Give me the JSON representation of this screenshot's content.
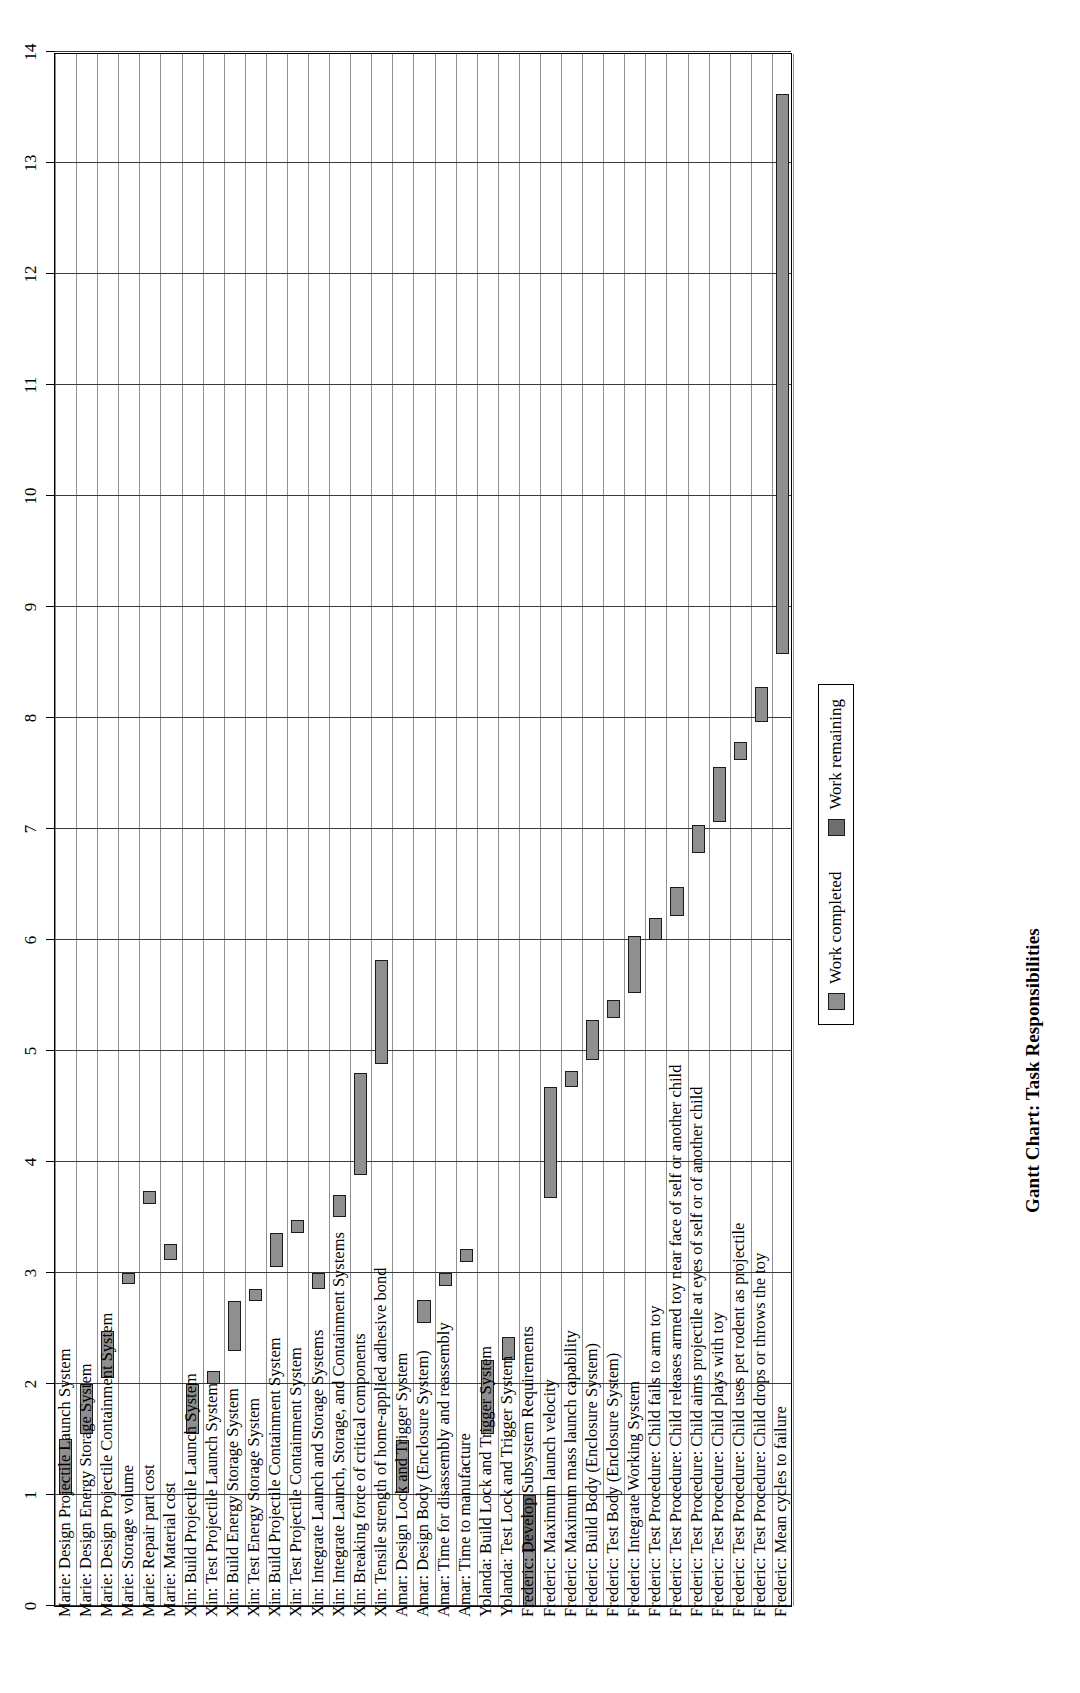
{
  "chart_data": {
    "type": "bar",
    "title": "Gantt Chart: Task Responsibilities",
    "xlabel": "",
    "ylabel": "",
    "ylim": [
      0,
      14
    ],
    "grid": true,
    "legend_position": "bottom-right",
    "orientation": "horizontal-rotated",
    "value_ticks": [
      0,
      1,
      2,
      3,
      4,
      5,
      6,
      7,
      8,
      9,
      10,
      11,
      12,
      13,
      14
    ],
    "series": [
      {
        "name": "Work completed",
        "color": "#8f8f8f"
      },
      {
        "name": "Work remaining",
        "color": "#6f6f6f"
      }
    ],
    "categories": [
      "Marie: Design Projectile Launch System",
      "Marie: Design Energy Storage System",
      "Marie: Design Projectile Containment System",
      "Marie: Storage volume",
      "Marie: Repair part cost",
      "Marie: Material cost",
      "Xin: Build Projectile Launch System",
      "Xin: Test Projectile Launch System",
      "Xin: Build Energy Storage System",
      "Xin: Test Energy Storage System",
      "Xin: Build Projectile Containment System",
      "Xin: Test Projectile Containment System",
      "Xin: Integrate Launch and Storage Systems",
      "Xin: Integrate Launch, Storage, and Containment Systems",
      "Xin: Breaking force of critical components",
      "Xin: Tensile strength of home-applied adhesive bond",
      "Amar: Design Lock and Trigger System",
      "Amar: Design Body (Enclosure System)",
      "Amar: Time for disassembly and reassembly",
      "Amar: Time to manufacture",
      "Yolanda: Build Lock and Trigger System",
      "Yolanda: Test Lock and Trigger System",
      "Frederic: Develop Subsystem Requirements",
      "Frederic: Maximum launch velocity",
      "Frederic: Maximum mass launch capability",
      "Frederic: Build Body (Enclosure System)",
      "Frederic: Test Body (Enclosure System)",
      "Frederic: Integrate Working System",
      "Frederic: Test Procedure: Child fails to arm toy",
      "Frederic: Test Procedure: Child releases armed toy near face of self or another child",
      "Frederic: Test Procedure: Child aims projectile at eyes of self or of another child",
      "Frederic: Test Procedure: Child plays with toy",
      "Frederic: Test Procedure: Child uses pet rodent as projectile",
      "Frederic: Test Procedure: Child drops or throws the toy",
      "Frederic: Mean cycles to failure"
    ],
    "bars": [
      {
        "category": "Marie: Design Projectile Launch System",
        "start": 1.0,
        "end": 1.5,
        "split": null
      },
      {
        "category": "Marie: Design Energy Storage System",
        "start": 1.55,
        "end": 2.0,
        "split": null
      },
      {
        "category": "Marie: Design Projectile Containment System",
        "start": 2.05,
        "end": 2.48,
        "split": null
      },
      {
        "category": "Marie: Storage volume",
        "start": 2.9,
        "end": 3.0,
        "split": null
      },
      {
        "category": "Marie: Repair part cost",
        "start": 3.62,
        "end": 3.74,
        "split": null
      },
      {
        "category": "Marie: Material cost",
        "start": 3.12,
        "end": 3.26,
        "split": null
      },
      {
        "category": "Xin: Build Projectile Launch System",
        "start": 1.55,
        "end": 2.0,
        "split": null
      },
      {
        "category": "Xin: Test Projectile Launch System",
        "start": 2.0,
        "end": 2.12,
        "split": null
      },
      {
        "category": "Xin: Build Energy Storage System",
        "start": 2.3,
        "end": 2.75,
        "split": null
      },
      {
        "category": "Xin: Test Energy Storage System",
        "start": 2.75,
        "end": 2.86,
        "split": null
      },
      {
        "category": "Xin: Build Projectile Containment System",
        "start": 3.05,
        "end": 3.36,
        "split": null
      },
      {
        "category": "Xin: Test Projectile Containment System",
        "start": 3.36,
        "end": 3.48,
        "split": null
      },
      {
        "category": "Xin: Integrate Launch and Storage Systems",
        "start": 2.86,
        "end": 3.0,
        "split": null
      },
      {
        "category": "Xin: Integrate Launch, Storage, and Containment Systems",
        "start": 3.5,
        "end": 3.7,
        "split": null
      },
      {
        "category": "Xin: Breaking force of critical components",
        "start": 3.88,
        "end": 4.8,
        "split": null
      },
      {
        "category": "Xin: Tensile strength of home-applied adhesive bond",
        "start": 4.88,
        "end": 5.82,
        "split": null
      },
      {
        "category": "Amar: Design Lock and Trigger System",
        "start": 1.02,
        "end": 1.5,
        "split": null
      },
      {
        "category": "Amar: Design Body (Enclosure System)",
        "start": 2.55,
        "end": 2.76,
        "split": null
      },
      {
        "category": "Amar: Time for disassembly and reassembly",
        "start": 2.88,
        "end": 3.0,
        "split": null
      },
      {
        "category": "Amar: Time to manufacture",
        "start": 3.1,
        "end": 3.22,
        "split": null
      },
      {
        "category": "Yolanda: Build Lock and Trigger System",
        "start": 1.55,
        "end": 2.22,
        "split": null
      },
      {
        "category": "Yolanda: Test Lock and Trigger System",
        "start": 2.22,
        "end": 2.42,
        "split": null
      },
      {
        "category": "Frederic: Develop Subsystem Requirements",
        "start": 0.0,
        "end": 1.0,
        "split": 0.5
      },
      {
        "category": "Frederic: Maximum launch velocity",
        "start": 3.68,
        "end": 4.68,
        "split": null
      },
      {
        "category": "Frederic: Maximum mass launch capability",
        "start": 4.68,
        "end": 4.82,
        "split": null
      },
      {
        "category": "Frederic: Build Body (Enclosure System)",
        "start": 4.92,
        "end": 5.28,
        "split": null
      },
      {
        "category": "Frederic: Test Body (Enclosure System)",
        "start": 5.3,
        "end": 5.46,
        "split": null
      },
      {
        "category": "Frederic: Integrate Working System",
        "start": 5.52,
        "end": 6.04,
        "split": null
      },
      {
        "category": "Frederic: Test Procedure: Child fails to arm toy",
        "start": 6.0,
        "end": 6.2,
        "split": null
      },
      {
        "category": "Frederic: Test Procedure: Child releases armed toy near face of self or another child",
        "start": 6.22,
        "end": 6.48,
        "split": null
      },
      {
        "category": "Frederic: Test Procedure: Child aims projectile at eyes of self or of another child",
        "start": 6.78,
        "end": 7.04,
        "split": null
      },
      {
        "category": "Frederic: Test Procedure: Child plays with toy",
        "start": 7.06,
        "end": 7.56,
        "split": null
      },
      {
        "category": "Frederic: Test Procedure: Child uses pet rodent as projectile",
        "start": 7.62,
        "end": 7.78,
        "split": null
      },
      {
        "category": "Frederic: Test Procedure: Child drops or throws the toy",
        "start": 7.96,
        "end": 8.28,
        "split": null
      },
      {
        "category": "Frederic: Mean cycles to failure",
        "start": 8.58,
        "end": 13.62,
        "split": null
      }
    ]
  },
  "legend": {
    "items": [
      {
        "label": "Work completed"
      },
      {
        "label": "Work remaining"
      }
    ]
  }
}
